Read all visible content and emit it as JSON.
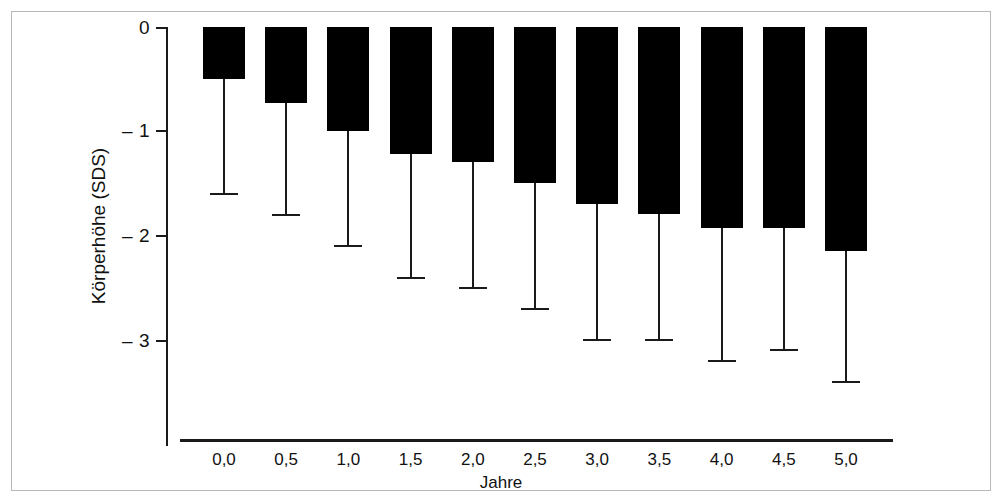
{
  "chart_data": {
    "type": "bar",
    "title": "",
    "subtitle": "",
    "xlabel": "Jahre",
    "ylabel": "Körperhöhe (SDS)",
    "categories": [
      "0,0",
      "0,5",
      "1,0",
      "1,5",
      "2,0",
      "2,5",
      "3,0",
      "3,5",
      "4,0",
      "4,5",
      "5,0"
    ],
    "values": [
      -0.5,
      -0.73,
      -1.0,
      -1.22,
      -1.3,
      -1.5,
      -1.7,
      -1.8,
      -1.93,
      -1.93,
      -2.15
    ],
    "error_low": [
      -1.6,
      -1.8,
      -2.1,
      -2.4,
      -2.5,
      -2.7,
      -3.0,
      -3.0,
      -3.2,
      -3.1,
      -3.4
    ],
    "ytick_labels": [
      "0",
      "– 1",
      "– 2",
      "– 3"
    ],
    "ytick_values": [
      0,
      -1,
      -2,
      -3
    ],
    "ylim": [
      -3.55,
      0
    ],
    "grid": false,
    "legend": null,
    "bar_color": "#000000",
    "axis_color": "#1a1a1a",
    "background_color": "#ffffff",
    "orientation": "downward-bars-from-zero",
    "error_bar_style": "lower-whisker-with-cap"
  }
}
